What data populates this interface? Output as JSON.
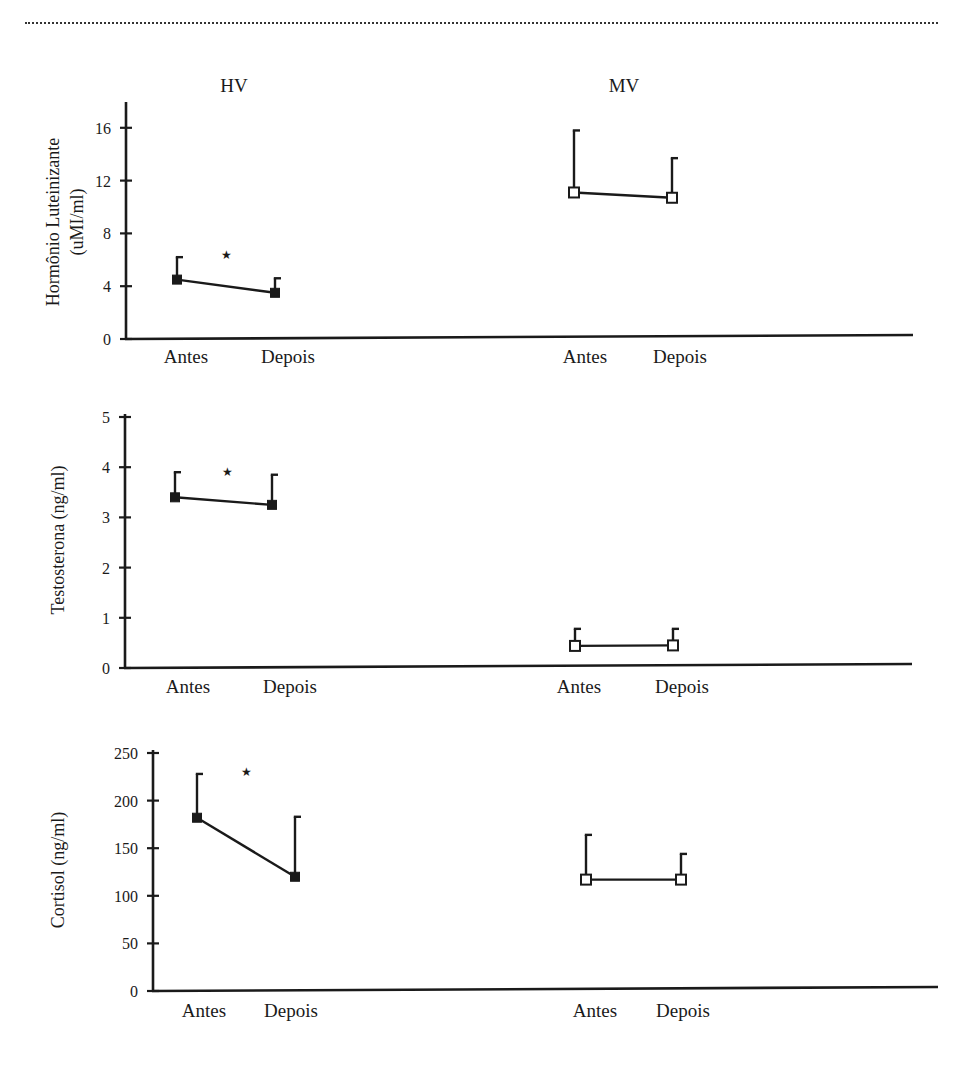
{
  "header": {
    "divider": "dotted-rule"
  },
  "groups": [
    {
      "id": "hv",
      "label": "HV",
      "marker": "filled-square"
    },
    {
      "id": "mv",
      "label": "MV",
      "marker": "open-square"
    }
  ],
  "x_categories": [
    "Antes",
    "Depois"
  ],
  "significance_marker": "★",
  "colors": {
    "ink": "#1a1a1a",
    "background": "#ffffff"
  },
  "chart_data": [
    {
      "type": "line",
      "title": "",
      "ylabel_lines": [
        "Hormônio Luteinizante",
        "(uMI/ml)"
      ],
      "ylabel": "Hormônio Luteinizante (uMI/ml)",
      "xlabel": "",
      "ylim": [
        0,
        18
      ],
      "yticks": [
        0,
        4,
        8,
        12,
        16
      ],
      "categories": [
        "Antes",
        "Depois"
      ],
      "series": [
        {
          "name": "HV",
          "marker": "filled-square",
          "values": [
            4.5,
            3.5
          ],
          "error_upper": [
            6.2,
            4.6
          ],
          "significant": true
        },
        {
          "name": "MV",
          "marker": "open-square",
          "values": [
            11.1,
            10.7
          ],
          "error_upper": [
            15.8,
            13.7
          ],
          "significant": false
        }
      ],
      "grid": false,
      "legend": "group headers above panels (HV, MV)"
    },
    {
      "type": "line",
      "title": "",
      "ylabel_lines": [
        "Testosterona (ng/ml)"
      ],
      "ylabel": "Testosterona (ng/ml)",
      "xlabel": "",
      "ylim": [
        0,
        5
      ],
      "yticks": [
        0,
        1,
        2,
        3,
        4,
        5
      ],
      "categories": [
        "Antes",
        "Depois"
      ],
      "series": [
        {
          "name": "HV",
          "marker": "filled-square",
          "values": [
            3.4,
            3.25
          ],
          "error_upper": [
            3.9,
            3.85
          ],
          "significant": true
        },
        {
          "name": "MV",
          "marker": "open-square",
          "values": [
            0.44,
            0.45
          ],
          "error_upper": [
            0.78,
            0.78
          ],
          "significant": false
        }
      ],
      "grid": false
    },
    {
      "type": "line",
      "title": "",
      "ylabel_lines": [
        "Cortisol (ng/ml)"
      ],
      "ylabel": "Cortisol (ng/ml)",
      "xlabel": "",
      "ylim": [
        0,
        250
      ],
      "yticks": [
        0,
        50,
        100,
        150,
        200,
        250
      ],
      "categories": [
        "Antes",
        "Depois"
      ],
      "series": [
        {
          "name": "HV",
          "marker": "filled-square",
          "values": [
            182,
            120
          ],
          "error_upper": [
            228,
            183
          ],
          "significant": true
        },
        {
          "name": "MV",
          "marker": "open-square",
          "values": [
            117,
            117
          ],
          "error_upper": [
            164,
            144
          ],
          "significant": false
        }
      ],
      "grid": false
    }
  ],
  "layout": {
    "panels": [
      {
        "axis_x": 126,
        "y0": 339,
        "ytop": 102,
        "px_per_unit": 13.2,
        "x_end": 913,
        "x_end_y": 335,
        "xs": {
          "HV": [
            177,
            275
          ],
          "MV": [
            574,
            672
          ]
        },
        "label_y": 363,
        "label_x": {
          "HV": [
            186,
            288
          ],
          "MV": [
            585,
            680
          ]
        },
        "star": [
          226,
          254
        ],
        "ylabel_x": [
          53,
          77
        ],
        "ylabel_cy": 222,
        "tick_label_x": 111
      },
      {
        "axis_x": 125,
        "y0": 668,
        "ytop": 414,
        "px_per_unit": 50.2,
        "x_end": 912,
        "x_end_y": 664,
        "xs": {
          "HV": [
            175,
            272
          ],
          "MV": [
            575,
            673
          ]
        },
        "label_y": 693,
        "label_x": {
          "HV": [
            188,
            290
          ],
          "MV": [
            579,
            682
          ]
        },
        "star": [
          227,
          471
        ],
        "ylabel_x": [
          58
        ],
        "ylabel_cy": 540,
        "tick_label_x": 110
      },
      {
        "axis_x": 153,
        "y0": 991,
        "ytop": 750,
        "px_per_unit": 0.952,
        "x_end": 938,
        "x_end_y": 987,
        "xs": {
          "HV": [
            197,
            295
          ],
          "MV": [
            586,
            681
          ]
        },
        "label_y": 1017,
        "label_x": {
          "HV": [
            204,
            291
          ],
          "MV": [
            595,
            683
          ]
        },
        "star": [
          246,
          771
        ],
        "ylabel_x": [
          58
        ],
        "ylabel_cy": 870,
        "tick_label_x": 138
      }
    ],
    "group_title_pos": {
      "HV": [
        234,
        92
      ],
      "MV": [
        624,
        92
      ]
    }
  }
}
